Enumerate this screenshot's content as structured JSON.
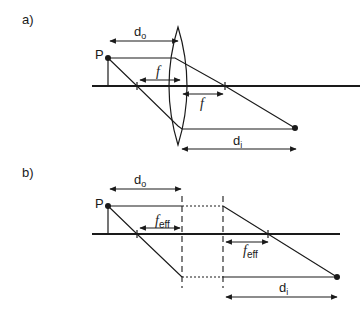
{
  "panel_a": {
    "label": "a)",
    "object_label": "P",
    "object_distance_label": "d",
    "object_distance_sub": "o",
    "focal_label": "f",
    "image_distance_label": "d",
    "image_distance_sub": "i"
  },
  "panel_b": {
    "label": "b)",
    "object_label": "P",
    "object_distance_label": "d",
    "object_distance_sub": "o",
    "focal_label": "f",
    "focal_sub": "eff",
    "image_distance_label": "d",
    "image_distance_sub": "i"
  },
  "colors": {
    "line": "#1a1a1a",
    "background": "#ffffff"
  }
}
